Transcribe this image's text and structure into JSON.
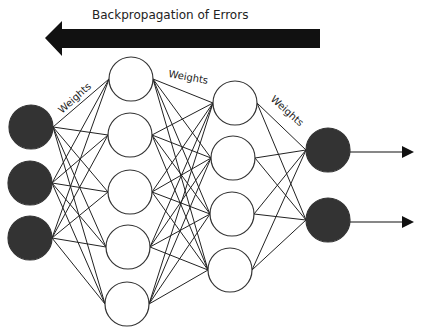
{
  "title": "Backpropagation of Errors",
  "weights_labels": [
    "Weights",
    "Weights",
    "Weights"
  ],
  "network": {
    "layers": [
      {
        "name": "input",
        "nodes": 3,
        "filled": true
      },
      {
        "name": "hidden-1",
        "nodes": 5,
        "filled": false
      },
      {
        "name": "hidden-2",
        "nodes": 4,
        "filled": false
      },
      {
        "name": "output",
        "nodes": 2,
        "filled": true
      }
    ],
    "connectivity": "fully-connected",
    "output_arrows": 2
  },
  "colors": {
    "node_fill_dark": "#333333",
    "node_fill_light": "#ffffff",
    "edge": "#222222",
    "arrow": "#111111"
  }
}
